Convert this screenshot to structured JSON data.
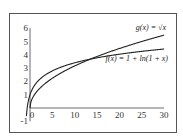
{
  "chart_data": {
    "type": "line",
    "title": "",
    "xlabel": "",
    "ylabel": "",
    "xlim": [
      -1,
      30
    ],
    "ylim": [
      -1,
      6
    ],
    "x_ticks": [
      "0",
      "5",
      "10",
      "15",
      "20",
      "25",
      "30"
    ],
    "y_ticks": [
      "-1",
      "1",
      "2",
      "3",
      "4",
      "5",
      "6"
    ],
    "grid": false,
    "legend": "inline annotations",
    "series": [
      {
        "name": "g(x) = √x",
        "label": "g(x) = √x",
        "x": [
          0,
          1,
          2,
          5,
          10,
          13,
          15,
          20,
          25,
          30
        ],
        "values": [
          0,
          1,
          1.41,
          2.24,
          3.16,
          3.61,
          3.87,
          4.47,
          5.0,
          5.48
        ]
      },
      {
        "name": "f(x) = 1 + ln(1 + x)",
        "label": "f(x) = 1 + ln(1 + x)",
        "x": [
          -0.8,
          -0.5,
          0,
          1,
          2,
          5,
          10,
          13,
          15,
          20,
          25,
          30
        ],
        "values": [
          -0.61,
          0.31,
          1,
          1.69,
          2.1,
          2.79,
          3.4,
          3.64,
          3.77,
          4.04,
          4.26,
          4.43
        ]
      }
    ]
  }
}
